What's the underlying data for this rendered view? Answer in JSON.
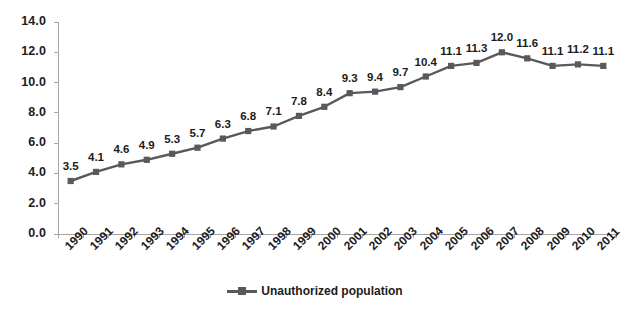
{
  "chart_data": {
    "type": "line",
    "title": "",
    "subtitle": "",
    "xlabel": "",
    "ylabel": "",
    "categories": [
      "1990",
      "1991",
      "1992",
      "1993",
      "1994",
      "1995",
      "1996",
      "1997",
      "1998",
      "1999",
      "2000",
      "2001",
      "2002",
      "2003",
      "2004",
      "2005",
      "2006",
      "2007",
      "2008",
      "2009",
      "2010",
      "2011"
    ],
    "series": [
      {
        "name": "Unauthorized population",
        "values": [
          3.5,
          4.1,
          4.6,
          4.9,
          5.3,
          5.7,
          6.3,
          6.8,
          7.1,
          7.8,
          8.4,
          9.3,
          9.4,
          9.7,
          10.4,
          11.1,
          11.3,
          12.0,
          11.6,
          11.1,
          11.2,
          11.1
        ],
        "labels": [
          "3.5",
          "4.1",
          "4.6",
          "4.9",
          "5.3",
          "5.7",
          "6.3",
          "6.8",
          "7.1",
          "7.8",
          "8.4",
          "9.3",
          "9.4",
          "9.7",
          "10.4",
          "11.1",
          "11.3",
          "12.0",
          "11.6",
          "11.1",
          "11.2",
          "11.1"
        ],
        "color": "#595959",
        "marker": "square"
      }
    ],
    "ylim": [
      0.0,
      14.0
    ],
    "yticks": [
      0.0,
      2.0,
      4.0,
      6.0,
      8.0,
      10.0,
      12.0,
      14.0
    ],
    "ytick_labels": [
      "0.0",
      "2.0",
      "4.0",
      "6.0",
      "8.0",
      "10.0",
      "12.0",
      "14.0"
    ],
    "grid": false,
    "legend_position": "bottom",
    "legend": [
      "Unauthorized population"
    ],
    "annotations": [],
    "axis_color": "#a6a6a6",
    "background": "#ffffff"
  },
  "legend": {
    "label": "Unauthorized population"
  }
}
